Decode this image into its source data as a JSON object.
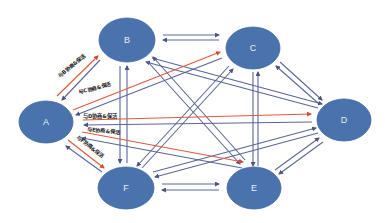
{
  "colors": {
    "node_fill": "#4a72ad",
    "node_stroke": "#4068a4",
    "link_blue": "#5a6698",
    "link_red": "#e05a3e",
    "background": "#ffffff"
  },
  "nodes": [
    {
      "id": "A",
      "label": "A",
      "cx": 46,
      "cy": 122,
      "rx": 27,
      "ry": 21
    },
    {
      "id": "B",
      "label": "B",
      "cx": 127,
      "cy": 40,
      "rx": 28,
      "ry": 22
    },
    {
      "id": "C",
      "label": "C",
      "cx": 253,
      "cy": 48,
      "rx": 27,
      "ry": 21
    },
    {
      "id": "D",
      "label": "D",
      "cx": 344,
      "cy": 120,
      "rx": 27,
      "ry": 21
    },
    {
      "id": "E",
      "label": "E",
      "cx": 254,
      "cy": 188,
      "rx": 27,
      "ry": 21
    },
    {
      "id": "F",
      "label": "F",
      "cx": 126,
      "cy": 188,
      "rx": 28,
      "ry": 21
    }
  ],
  "edge_labels": [
    {
      "text": "与B协商&保活",
      "x": 60,
      "y": 78,
      "rotate": -40
    },
    {
      "text": "与C协商&保活",
      "x": 79,
      "y": 94,
      "rotate": -14
    },
    {
      "text": "与D协商&保活",
      "x": 83,
      "y": 118,
      "rotate": 0
    },
    {
      "text": "与E协商&保活",
      "x": 87,
      "y": 131,
      "rotate": 6
    },
    {
      "text": "与F协商&保活",
      "x": 76,
      "y": 138,
      "rotate": 38
    }
  ],
  "red_links": [
    {
      "from": "A",
      "to": "B",
      "x1": 57,
      "y1": 96,
      "x2": 98,
      "y2": 56
    },
    {
      "from": "A",
      "to": "C",
      "x1": 73,
      "y1": 110,
      "x2": 220,
      "y2": 52
    },
    {
      "from": "A",
      "to": "D",
      "x1": 83,
      "y1": 120,
      "x2": 311,
      "y2": 114
    },
    {
      "from": "A",
      "to": "E",
      "x1": 82,
      "y1": 132,
      "x2": 243,
      "y2": 162
    },
    {
      "from": "A",
      "to": "F",
      "x1": 68,
      "y1": 140,
      "x2": 104,
      "y2": 168
    }
  ],
  "blue_links": [
    {
      "x1": 100,
      "y1": 60,
      "x2": 62,
      "y2": 100
    },
    {
      "x1": 222,
      "y1": 58,
      "x2": 76,
      "y2": 115
    },
    {
      "x1": 312,
      "y1": 122,
      "x2": 84,
      "y2": 125
    },
    {
      "x1": 242,
      "y1": 168,
      "x2": 82,
      "y2": 138
    },
    {
      "x1": 102,
      "y1": 172,
      "x2": 66,
      "y2": 146
    },
    {
      "x1": 163,
      "y1": 35,
      "x2": 219,
      "y2": 35
    },
    {
      "x1": 219,
      "y1": 40,
      "x2": 163,
      "y2": 40
    },
    {
      "x1": 120,
      "y1": 66,
      "x2": 120,
      "y2": 163
    },
    {
      "x1": 127,
      "y1": 163,
      "x2": 127,
      "y2": 66
    },
    {
      "x1": 152,
      "y1": 58,
      "x2": 322,
      "y2": 104
    },
    {
      "x1": 318,
      "y1": 108,
      "x2": 146,
      "y2": 62
    },
    {
      "x1": 148,
      "y1": 62,
      "x2": 240,
      "y2": 164
    },
    {
      "x1": 245,
      "y1": 160,
      "x2": 153,
      "y2": 57
    },
    {
      "x1": 229,
      "y1": 66,
      "x2": 137,
      "y2": 166
    },
    {
      "x1": 142,
      "y1": 168,
      "x2": 233,
      "y2": 69
    },
    {
      "x1": 253,
      "y1": 72,
      "x2": 253,
      "y2": 166
    },
    {
      "x1": 258,
      "y1": 166,
      "x2": 258,
      "y2": 72
    },
    {
      "x1": 280,
      "y1": 62,
      "x2": 322,
      "y2": 100
    },
    {
      "x1": 318,
      "y1": 103,
      "x2": 276,
      "y2": 66
    },
    {
      "x1": 153,
      "y1": 172,
      "x2": 316,
      "y2": 128
    },
    {
      "x1": 318,
      "y1": 133,
      "x2": 155,
      "y2": 177
    },
    {
      "x1": 275,
      "y1": 170,
      "x2": 319,
      "y2": 138
    },
    {
      "x1": 323,
      "y1": 142,
      "x2": 279,
      "y2": 174
    },
    {
      "x1": 162,
      "y1": 184,
      "x2": 219,
      "y2": 184
    },
    {
      "x1": 219,
      "y1": 190,
      "x2": 162,
      "y2": 190
    }
  ]
}
